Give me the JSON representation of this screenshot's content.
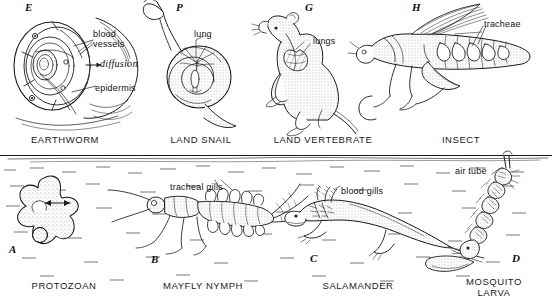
{
  "figure": {
    "divider": "water-surface-line",
    "ink_color": "#1a1a1a",
    "background_color": "#ffffff"
  },
  "top_row": {
    "environment": "land",
    "panels": [
      {
        "letter": "E",
        "caption": "EARTHWORM",
        "labels": [
          {
            "text": "blood\nvessels",
            "style": "upright"
          },
          {
            "text": "diffusion",
            "style": "italic"
          },
          {
            "text": "epidermis",
            "style": "upright"
          }
        ]
      },
      {
        "letter": "P",
        "caption": "LAND SNAIL",
        "labels": [
          {
            "text": "lung",
            "style": "upright"
          }
        ]
      },
      {
        "letter": "G",
        "caption": "LAND VERTEBRATE",
        "labels": [
          {
            "text": "lungs",
            "style": "upright"
          }
        ]
      },
      {
        "letter": "H",
        "caption": "INSECT",
        "labels": [
          {
            "text": "tracheae",
            "style": "upright"
          }
        ]
      }
    ]
  },
  "bottom_row": {
    "environment": "water",
    "panels": [
      {
        "letter": "A",
        "caption": "PROTOZOAN",
        "labels": []
      },
      {
        "letter": "B",
        "caption": "MAYFLY NYMPH",
        "labels": [
          {
            "text": "tracheal gills",
            "style": "upright"
          }
        ]
      },
      {
        "letter": "C",
        "caption": "SALAMANDER",
        "labels": [
          {
            "text": "blood gills",
            "style": "upright"
          }
        ]
      },
      {
        "letter": "D",
        "caption": "MOSQUITO\nLARVA",
        "labels": [
          {
            "text": "air tube",
            "style": "upright"
          }
        ]
      }
    ]
  }
}
